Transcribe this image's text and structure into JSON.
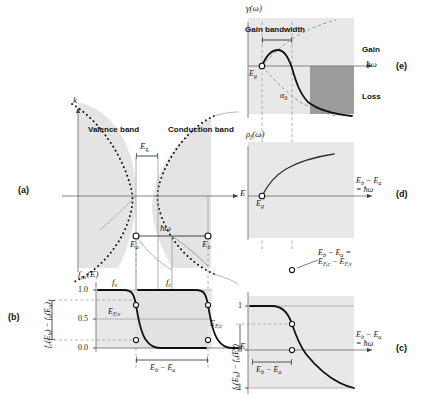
{
  "figure": {
    "title_internal": "Semiconductor optical gain: band structure, Fermi occupation, joint density of states and gain spectrum",
    "panel_labels": {
      "a": "(a)",
      "b": "(b)",
      "c": "(c)",
      "d": "(d)",
      "e": "(e)"
    },
    "colors": {
      "ink": "#1a1a1a",
      "curve": "#111111",
      "shade_light": "#e6e6e6",
      "shade_mid": "#d5d5d5",
      "shade_dark": "#9a9a9a",
      "axis": "#666666",
      "dashed": "#8a8a8a",
      "marker_fill": "#ffffff"
    }
  },
  "panel_a": {
    "label": "(a)",
    "y_axis_label": "k",
    "x_axis_label": "E",
    "band_left_label": "Valence band",
    "band_right_label": "Conduction band",
    "gap_label": "E",
    "gap_label_sub": "g",
    "photon_label": "ħω",
    "state_a_label": "E",
    "state_a_sub": "a",
    "state_b_label": "E",
    "state_b_sub": "b"
  },
  "panel_b": {
    "label": "(b)",
    "y_axis_label": "f",
    "y_axis_sub": "v,c",
    "y_axis_arg": "(E)",
    "x_axis_label": "E",
    "y_ticks": [
      "1.0",
      "0.5",
      "0.0"
    ],
    "curve_v_label": "f",
    "curve_v_sub": "v",
    "curve_c_label": "f",
    "curve_c_sub": "c",
    "fermi_v_label": "E",
    "fermi_v_sub": "F,v",
    "fermi_c_label": "E",
    "fermi_c_sub": "F,c",
    "bracket_label": "E",
    "bracket_sub_b": "b",
    "bracket_minus": " − E",
    "bracket_sub_a": "a",
    "side_label": "f_c(E_b) − f_v(E_a)"
  },
  "panel_c": {
    "label": "(c)",
    "y_axis_label": "f_c(E_b) − f_v(E_a)",
    "y_ticks": [
      "1",
      "0",
      "-1"
    ],
    "x_axis_line1": "E",
    "x_axis_line1_sub_b": "b",
    "x_axis_line1_mid": " − E",
    "x_axis_line1_sub_a": "a",
    "x_axis_line2": "= ħω",
    "bracket_label": "E",
    "bracket_sub_b": "b",
    "bracket_minus": " − E",
    "bracket_sub_a": "a"
  },
  "panel_d": {
    "label": "(d)",
    "y_axis_label": "ρ",
    "y_axis_sub": "j",
    "y_axis_arg": "(ω)",
    "gap_point_label": "E",
    "gap_point_sub": "g",
    "x_axis_line1": "E",
    "x_axis_line1_sub_b": "b",
    "x_axis_line1_mid": " − E",
    "x_axis_line1_sub_a": "a",
    "x_axis_line2": "= ħω"
  },
  "panel_e": {
    "label": "(e)",
    "y_axis_label": "γ(ω)",
    "x_axis_label": "ħω",
    "bandwidth_label": "Gain bandwidth",
    "gap_point_label": "E",
    "gap_point_sub": "g",
    "alpha_label": "α",
    "alpha_sub": "0",
    "gain_region_label": "Gain",
    "loss_region_label": "Loss"
  },
  "annotation_center": {
    "line1": "E",
    "line1_sub_b": "b",
    "line1_mid": " − E",
    "line1_sub_a": "a",
    "line1_eq": " =",
    "line2": "E",
    "line2_sub_c": "F,c",
    "line2_mid": " − E",
    "line2_sub_v": "F,v"
  }
}
